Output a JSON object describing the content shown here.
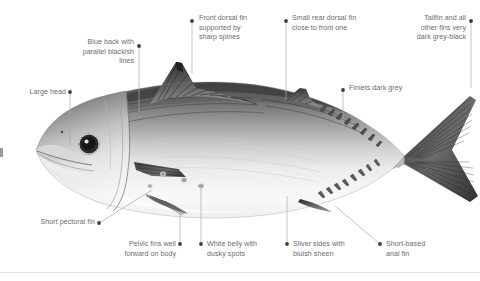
{
  "figure": {
    "background_color": "#ffffff",
    "label_color": "#6b6b6b",
    "leader_color": "#a9a9a9",
    "dot_color": "#3d3d3d",
    "divider_color": "#e2e2e2"
  },
  "callouts": [
    {
      "id": "large-head",
      "text": "Large head",
      "align": "right",
      "text_x": 8,
      "text_y": 88,
      "text_w": 58,
      "dot_x": 70,
      "dot_y": 92,
      "leader": "vertical",
      "leader_to_x": 70,
      "leader_to_y": 146
    },
    {
      "id": "blue-back-parallel-lines",
      "text": "Blue back with\nparallel blackish\nlines",
      "align": "right",
      "text_x": 58,
      "text_y": 38,
      "text_w": 76,
      "dot_x": 139,
      "dot_y": 46,
      "leader": "vertical",
      "leader_to_x": 139,
      "leader_to_y": 112
    },
    {
      "id": "front-dorsal-fin",
      "text": "Front dorsal fin\nsupported by\nsharp spines",
      "align": "left",
      "text_x": 199,
      "text_y": 14,
      "text_w": 80,
      "dot_x": 192,
      "dot_y": 21,
      "leader": "vertical",
      "leader_to_x": 192,
      "leader_to_y": 74
    },
    {
      "id": "small-rear-dorsal-fin",
      "text": "Small rear dorsal fin\nclose to front one",
      "align": "left",
      "text_x": 292,
      "text_y": 14,
      "text_w": 94,
      "dot_x": 286,
      "dot_y": 21,
      "leader": "vertical",
      "leader_to_x": 286,
      "leader_to_y": 100
    },
    {
      "id": "tailfin-dark-grey-black",
      "text": "Tailfin and all\nother fins very\ndark grey-black",
      "align": "right",
      "text_x": 393,
      "text_y": 14,
      "text_w": 73,
      "dot_x": 471,
      "dot_y": 21,
      "leader": "vertical",
      "leader_to_x": 471,
      "leader_to_y": 88
    },
    {
      "id": "finlets-dark-grey",
      "text": "Finlets dark grey",
      "align": "left",
      "text_x": 349,
      "text_y": 84,
      "text_w": 76,
      "dot_x": 343,
      "dot_y": 90,
      "leader": "vertical",
      "leader_to_x": 343,
      "leader_to_y": 126
    },
    {
      "id": "short-pectoral-fin",
      "text": "Short pectoral fin",
      "align": "right",
      "text_x": 18,
      "text_y": 218,
      "text_w": 77,
      "dot_x": 99,
      "dot_y": 223,
      "leader": "diagonal",
      "leader_to_x": 152,
      "leader_to_y": 190
    },
    {
      "id": "pelvic-fins-forward",
      "text": "Pelvic fins well\nforward on body",
      "align": "right",
      "text_x": 110,
      "text_y": 240,
      "text_w": 66,
      "dot_x": 180,
      "dot_y": 244,
      "leader": "vertical",
      "leader_to_x": 180,
      "leader_to_y": 212
    },
    {
      "id": "white-belly-dusky-spots",
      "text": "White belly with\ndusky spots",
      "align": "left",
      "text_x": 207,
      "text_y": 240,
      "text_w": 70,
      "dot_x": 201,
      "dot_y": 244,
      "leader": "vertical",
      "leader_to_x": 201,
      "leader_to_y": 186
    },
    {
      "id": "silver-sides-bluish-sheen",
      "text": "Silver sides with\nbluish sheen",
      "align": "left",
      "text_x": 293,
      "text_y": 240,
      "text_w": 70,
      "dot_x": 287,
      "dot_y": 244,
      "leader": "vertical",
      "leader_to_x": 287,
      "leader_to_y": 196
    },
    {
      "id": "short-based-anal-fin",
      "text": "Short-based\nanal fin",
      "align": "left",
      "text_x": 386,
      "text_y": 240,
      "text_w": 60,
      "dot_x": 380,
      "dot_y": 244,
      "leader": "diagonal",
      "leader_to_x": 335,
      "leader_to_y": 206
    }
  ]
}
